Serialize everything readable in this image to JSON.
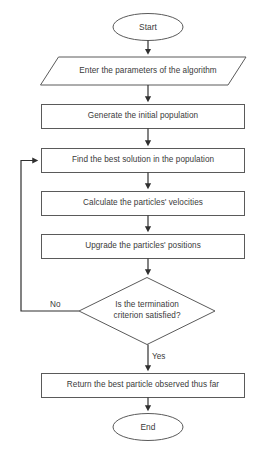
{
  "diagram": {
    "type": "flowchart",
    "background_color": "#ffffff",
    "line_color": "#5a5a5a",
    "text_color": "#3a3a3a"
  },
  "nodes": {
    "start": {
      "label": "Start",
      "shape": "ellipse"
    },
    "input_parameters": {
      "label": "Enter the parameters of the algorithm",
      "shape": "parallelogram"
    },
    "generate_population": {
      "label": "Generate the initial population",
      "shape": "rectangle"
    },
    "find_best_solution": {
      "label": "Find the best solution in the population",
      "shape": "rectangle"
    },
    "calculate_velocities": {
      "label": "Calculate the particles' velocities",
      "shape": "rectangle"
    },
    "upgrade_positions": {
      "label": "Upgrade the particles' positions",
      "shape": "rectangle"
    },
    "termination_check": {
      "label_line1": "Is the termination",
      "label_line2": "criterion satisfied?",
      "shape": "diamond"
    },
    "return_best": {
      "label": "Return the best particle observed thus far",
      "shape": "rectangle"
    },
    "end": {
      "label": "End",
      "shape": "ellipse"
    }
  },
  "edges": {
    "no_branch": {
      "label": "No"
    },
    "yes_branch": {
      "label": "Yes"
    }
  }
}
